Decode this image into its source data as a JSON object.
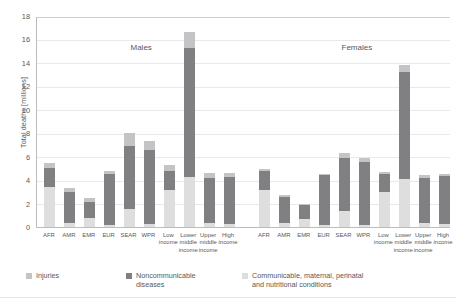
{
  "chart_data": {
    "type": "bar",
    "title": "",
    "subtype": "stacked-grouped",
    "ylabel": "Total deaths [millions]",
    "xlabel": "",
    "ylim": [
      0,
      18
    ],
    "yticks": [
      0,
      2,
      4,
      6,
      8,
      10,
      12,
      14,
      16,
      18
    ],
    "grid": true,
    "legend_position": "bottom",
    "panels": [
      {
        "name": "Males"
      },
      {
        "name": "Females"
      }
    ],
    "categories": [
      "AFR",
      "AMR",
      "EMR",
      "EUR",
      "SEAR",
      "WPR",
      "Low income",
      "Lower middle income",
      "Upper middle income",
      "High income"
    ],
    "category_lines": [
      [
        "AFR"
      ],
      [
        "AMR"
      ],
      [
        "EMR"
      ],
      [
        "EUR"
      ],
      [
        "SEAR"
      ],
      [
        "WPR"
      ],
      [
        "Low",
        "income"
      ],
      [
        "Lower",
        "middle",
        "income"
      ],
      [
        "Upper",
        "middle",
        "income"
      ],
      [
        "High",
        "income"
      ]
    ],
    "series": [
      {
        "name": "Communicable, maternal, perinatal and nutritional conditions",
        "legend_label": "Communicable, maternal, perinatal\nand nutritional conditions",
        "color": "#dededf",
        "values_males": [
          3.4,
          0.35,
          0.75,
          0.15,
          1.55,
          0.25,
          3.2,
          4.3,
          0.35,
          0.25
        ],
        "values_females": [
          3.2,
          0.3,
          0.7,
          0.15,
          1.35,
          0.2,
          3.0,
          4.1,
          0.3,
          0.25
        ]
      },
      {
        "name": "Noncommunicable diseases",
        "legend_label": "Noncommunicable\ndiseases",
        "color": "#808083",
        "values_males": [
          1.6,
          2.65,
          1.35,
          4.35,
          5.35,
          6.3,
          1.6,
          11.0,
          3.8,
          4.0
        ],
        "values_females": [
          1.55,
          2.3,
          1.15,
          4.25,
          4.5,
          5.35,
          1.5,
          9.1,
          3.9,
          4.1
        ]
      },
      {
        "name": "Injuries",
        "legend_label": "Injuries",
        "color": "#c4c4c6",
        "values_males": [
          0.45,
          0.35,
          0.35,
          0.3,
          1.1,
          0.75,
          0.5,
          1.3,
          0.45,
          0.35
        ],
        "values_females": [
          0.2,
          0.15,
          0.15,
          0.15,
          0.45,
          0.35,
          0.2,
          0.6,
          0.2,
          0.15
        ]
      }
    ],
    "totals_males": [
      5.45,
      3.35,
      2.45,
      4.8,
      8.0,
      7.3,
      5.3,
      16.6,
      4.6,
      4.6
    ],
    "totals_females": [
      4.95,
      2.75,
      2.0,
      4.55,
      6.3,
      5.9,
      4.7,
      13.8,
      4.4,
      4.5
    ]
  },
  "legend": [
    {
      "label": "Injuries",
      "color": "#c4c4c6"
    },
    {
      "label": "Noncommunicable\ndiseases",
      "color": "#808083"
    },
    {
      "label": "Communicable, maternal, perinatal\nand nutritional conditions",
      "color": "#dededf"
    }
  ]
}
